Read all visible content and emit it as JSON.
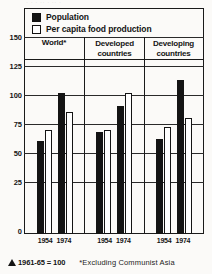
{
  "legend": {
    "items": [
      {
        "label": "Population",
        "swatch": "filled-square-icon",
        "color": "#141414"
      },
      {
        "label": "Per capita food production",
        "swatch": "hollow-square-icon",
        "color": "#ffffff"
      }
    ]
  },
  "footnotes": {
    "index_note": "1961-65 = 100",
    "index_icon": "triangle-icon",
    "asterisk_note": "*Excluding Communist Asia"
  },
  "caption_remnant": "· ·  · ··  · ·· ·",
  "chart_data": {
    "type": "bar",
    "title": "",
    "subtitle": "",
    "xlabel": "",
    "ylabel": "",
    "ylim": [
      0,
      150
    ],
    "yticks": [
      0,
      25,
      50,
      75,
      100,
      125,
      150
    ],
    "ytick_labels": [
      "0",
      "25",
      "50",
      "75",
      "100",
      "125",
      "150"
    ],
    "grid": true,
    "legend_position": "top",
    "groups": [
      {
        "name": "World*",
        "label_lines": [
          "World*"
        ],
        "years": [
          "1954",
          "1974"
        ]
      },
      {
        "name": "Developed countries",
        "label_lines": [
          "Developed",
          "countries"
        ],
        "years": [
          "1954",
          "1974"
        ]
      },
      {
        "name": "Developing countries",
        "label_lines": [
          "Developing",
          "countries"
        ],
        "years": [
          "1954",
          "1974"
        ]
      }
    ],
    "categories": [
      "World* 1954",
      "World* 1974",
      "Developed countries 1954",
      "Developed countries 1974",
      "Developing countries 1954",
      "Developing countries 1974"
    ],
    "series": [
      {
        "name": "Population",
        "color": "#141414",
        "values": [
          80,
          122,
          88,
          110,
          82,
          133
        ]
      },
      {
        "name": "Per capita food production",
        "color": "#ffffff",
        "values": [
          90,
          105,
          90,
          122,
          92,
          100
        ]
      }
    ]
  }
}
